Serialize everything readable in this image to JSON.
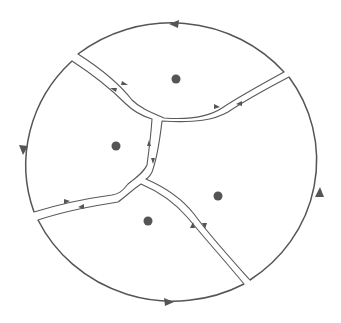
{
  "diagram": {
    "colors": {
      "stroke": "#555555",
      "background": "#ffffff",
      "dot": "#555555"
    },
    "outer_contour": {
      "shape": "circle",
      "arrows": [
        {
          "position": "top",
          "direction": "left"
        },
        {
          "position": "left",
          "direction": "down"
        },
        {
          "position": "right",
          "direction": "up"
        },
        {
          "position": "bottom",
          "direction": "right"
        }
      ]
    },
    "regions": [
      {
        "name": "top",
        "has_point": true
      },
      {
        "name": "left",
        "has_point": true
      },
      {
        "name": "right",
        "has_point": true
      },
      {
        "name": "bottom",
        "has_point": true
      }
    ],
    "channels": [
      {
        "name": "upper-left-channel",
        "arrows": [
          "toward-center",
          "toward-boundary"
        ]
      },
      {
        "name": "upper-right-channel",
        "arrows": [
          "toward-boundary",
          "toward-center"
        ]
      },
      {
        "name": "center-vertical-channel",
        "arrows": [
          "up",
          "down"
        ]
      },
      {
        "name": "lower-left-channel",
        "arrows": [
          "toward-center",
          "toward-boundary"
        ]
      },
      {
        "name": "lower-right-channel",
        "arrows": [
          "toward-center",
          "toward-boundary"
        ]
      }
    ]
  }
}
